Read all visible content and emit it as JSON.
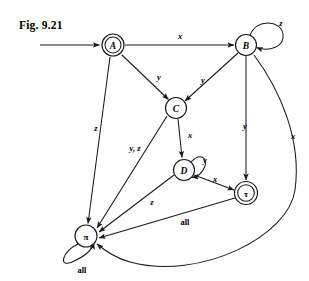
{
  "figure": {
    "caption": "Fig. 9.21",
    "type": "state-transition-diagram",
    "width": 309,
    "height": 281,
    "background_color": "#ffffff",
    "ink_color": "#1a1a1a"
  },
  "diagram": {
    "start_arrow": {
      "target": "A",
      "label": ""
    },
    "nodes": [
      {
        "id": "A",
        "label": "A",
        "x": 113,
        "y": 45,
        "r": 11,
        "accepting": true,
        "shape": "double-circle"
      },
      {
        "id": "B",
        "label": "B",
        "x": 246,
        "y": 45,
        "r": 10.5,
        "accepting": false,
        "shape": "circle"
      },
      {
        "id": "C",
        "label": "C",
        "x": 176,
        "y": 108,
        "r": 10.5,
        "accepting": false,
        "shape": "circle"
      },
      {
        "id": "D",
        "label": "D",
        "x": 184,
        "y": 170,
        "r": 10.5,
        "accepting": false,
        "shape": "circle"
      },
      {
        "id": "tau",
        "label": "τ",
        "x": 246,
        "y": 193,
        "r": 11,
        "accepting": true,
        "shape": "double-circle"
      },
      {
        "id": "pi",
        "label": "π",
        "x": 86,
        "y": 236,
        "r": 11,
        "accepting": false,
        "shape": "circle"
      }
    ],
    "edges": [
      {
        "from": "A",
        "to": "B",
        "label": "x",
        "kind": "straight"
      },
      {
        "from": "A",
        "to": "C",
        "label": "y",
        "kind": "straight"
      },
      {
        "from": "A",
        "to": "pi",
        "label": "z",
        "kind": "straight"
      },
      {
        "from": "B",
        "to": "B",
        "label": "z",
        "kind": "self-loop"
      },
      {
        "from": "B",
        "to": "C",
        "label": "y",
        "kind": "straight"
      },
      {
        "from": "B",
        "to": "tau",
        "label": "y",
        "kind": "straight"
      },
      {
        "from": "B",
        "to": "pi",
        "label": "x",
        "kind": "curve"
      },
      {
        "from": "C",
        "to": "D",
        "label": "x",
        "kind": "straight"
      },
      {
        "from": "C",
        "to": "pi",
        "label": "y, z",
        "kind": "straight"
      },
      {
        "from": "D",
        "to": "D",
        "label": "y",
        "kind": "self-loop"
      },
      {
        "from": "D",
        "to": "tau",
        "label": "x",
        "kind": "straight"
      },
      {
        "from": "D",
        "to": "pi",
        "label": "z",
        "kind": "straight"
      },
      {
        "from": "tau",
        "to": "pi",
        "label": "all",
        "kind": "straight"
      },
      {
        "from": "pi",
        "to": "pi",
        "label": "all",
        "kind": "self-loop"
      }
    ],
    "labels": [
      {
        "text": "x",
        "x": 180,
        "y": 36,
        "style": "italic"
      },
      {
        "text": "z",
        "x": 281,
        "y": 23,
        "style": "italic"
      },
      {
        "text": "y",
        "x": 159,
        "y": 77,
        "style": "italic"
      },
      {
        "text": "y",
        "x": 203,
        "y": 80,
        "style": "italic"
      },
      {
        "text": "z",
        "x": 96,
        "y": 128,
        "style": "italic"
      },
      {
        "text": "y",
        "x": 245,
        "y": 126,
        "style": "italic"
      },
      {
        "text": "x",
        "x": 293,
        "y": 136,
        "style": "italic"
      },
      {
        "text": "x",
        "x": 190,
        "y": 135,
        "style": "italic"
      },
      {
        "text": "y, z",
        "x": 135,
        "y": 148,
        "style": "italic"
      },
      {
        "text": "y",
        "x": 205,
        "y": 160,
        "style": "italic"
      },
      {
        "text": "x",
        "x": 215,
        "y": 179,
        "style": "italic"
      },
      {
        "text": "z",
        "x": 152,
        "y": 202,
        "style": "italic"
      },
      {
        "text": "all",
        "x": 185,
        "y": 222,
        "style": "upright"
      },
      {
        "text": "all",
        "x": 82,
        "y": 270,
        "style": "upright"
      }
    ]
  }
}
